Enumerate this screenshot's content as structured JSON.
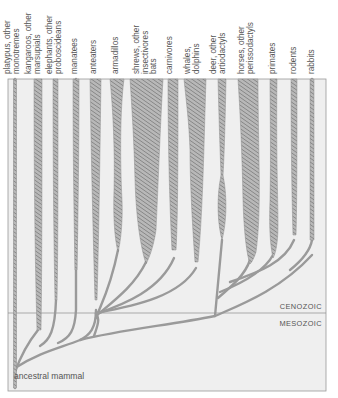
{
  "figure": {
    "root_label": "ancestral mammal",
    "eras": {
      "upper": "CENOZOIC",
      "lower": "MESOZOIC"
    },
    "colors": {
      "background": "#efefef",
      "frame": "#9a9a9a",
      "hatch": "#8a8a8a",
      "text": "#555555"
    },
    "taxa": [
      {
        "id": "platypus",
        "line1": "platypus, other",
        "line2": "monotremes",
        "x": 14
      },
      {
        "id": "kangaroos",
        "line1": "kangaroos, other",
        "line2": "marsupials",
        "x": 38
      },
      {
        "id": "elephants",
        "line1": "elephants, other",
        "line2": "proboscideans",
        "x": 56
      },
      {
        "id": "manatees",
        "line1": "manatees",
        "line2": "",
        "x": 76
      },
      {
        "id": "anteaters",
        "line1": "anteaters",
        "line2": "",
        "x": 96
      },
      {
        "id": "armadillos",
        "line1": "armadillos",
        "line2": "",
        "x": 118
      },
      {
        "id": "shrews",
        "line1": "shrews, other",
        "line2": "insectivores",
        "line3": "bats",
        "x": 146
      },
      {
        "id": "carnivores",
        "line1": "carnivores",
        "line2": "",
        "x": 174
      },
      {
        "id": "whales",
        "line1": "whales,",
        "line2": "dolphins",
        "x": 196
      },
      {
        "id": "deer",
        "line1": "deer, other",
        "line2": "artiodactyls",
        "x": 222
      },
      {
        "id": "horses",
        "line1": "horses, other",
        "line2": "perissodactyls",
        "x": 250
      },
      {
        "id": "primates",
        "line1": "primates",
        "line2": "",
        "x": 273
      },
      {
        "id": "rodents",
        "line1": "rodents",
        "line2": "",
        "x": 294
      },
      {
        "id": "rabbits",
        "line1": "rabbits",
        "line2": "",
        "x": 312
      }
    ]
  }
}
